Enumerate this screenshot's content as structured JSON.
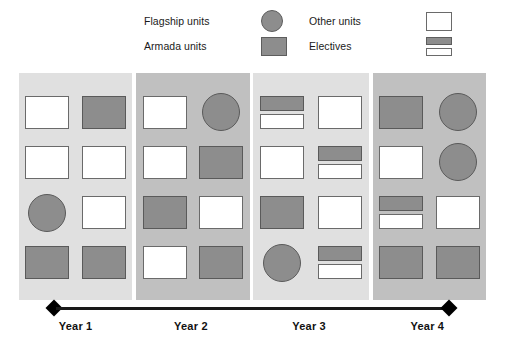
{
  "legend": {
    "items": [
      {
        "label": "Flagship units",
        "swatch": "circle-grey",
        "icon": "circle-icon"
      },
      {
        "label": "Other units",
        "swatch": "rect-white",
        "icon": "rectangle-outline-icon"
      },
      {
        "label": "Armada units",
        "swatch": "rect-grey",
        "icon": "rectangle-filled-icon"
      },
      {
        "label": "Electives",
        "swatch": "elective",
        "icon": "stacked-bars-icon"
      }
    ]
  },
  "axis": {
    "marker_left": "diamond-marker",
    "marker_right": "diamond-marker"
  },
  "chart_data": {
    "type": "table",
    "title": "",
    "xlabel": "",
    "ylabel": "",
    "categories": [
      "Year 1",
      "Year 2",
      "Year 3",
      "Year 4"
    ],
    "legend_position": "top",
    "grid": false,
    "unit_types": {
      "circle-grey": "Flagship units",
      "rect-white": "Other units",
      "rect-grey": "Armada units",
      "elective": "Electives"
    },
    "columns": [
      {
        "year": "Year 1",
        "shade": "light",
        "rows": [
          [
            "rect-white",
            "rect-grey"
          ],
          [
            "rect-white",
            "rect-white"
          ],
          [
            "circle-grey",
            "rect-white"
          ],
          [
            "rect-grey",
            "rect-grey"
          ]
        ]
      },
      {
        "year": "Year 2",
        "shade": "dark",
        "rows": [
          [
            "rect-white",
            "circle-grey"
          ],
          [
            "rect-white",
            "rect-grey"
          ],
          [
            "rect-grey",
            "rect-white"
          ],
          [
            "rect-white",
            "rect-grey"
          ]
        ]
      },
      {
        "year": "Year 3",
        "shade": "light",
        "rows": [
          [
            "elective",
            "rect-white"
          ],
          [
            "rect-white",
            "elective"
          ],
          [
            "rect-grey",
            "rect-white"
          ],
          [
            "circle-grey",
            "elective"
          ]
        ]
      },
      {
        "year": "Year 4",
        "shade": "dark",
        "rows": [
          [
            "rect-grey",
            "circle-grey"
          ],
          [
            "rect-white",
            "circle-grey"
          ],
          [
            "elective",
            "rect-white"
          ],
          [
            "rect-grey",
            "rect-grey"
          ]
        ]
      }
    ],
    "counts": {
      "circle-grey": 5,
      "rect-white": 13,
      "rect-grey": 10,
      "elective": 4
    }
  },
  "colors": {
    "grey_fill": "#8d8d8d",
    "grey_border": "#5a5a5a",
    "white_fill": "#ffffff",
    "white_border": "#6a6a6a",
    "col_light": "#e0e0e0",
    "col_dark": "#c0c0c0",
    "axis": "#1a1a1a",
    "text": "#111111"
  }
}
